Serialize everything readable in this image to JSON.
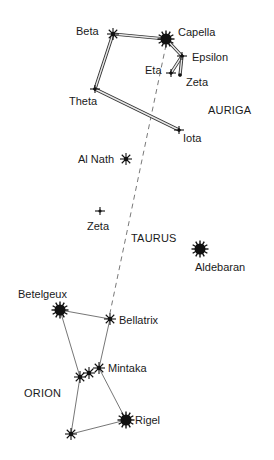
{
  "chart_data": {
    "type": "diagram",
    "title": "",
    "constellations": [
      {
        "name": "AURIGA",
        "label_pos": [
          208,
          104
        ]
      },
      {
        "name": "TAURUS",
        "label_pos": [
          131,
          232
        ]
      },
      {
        "name": "ORION",
        "label_pos": [
          24,
          387
        ]
      }
    ],
    "stars": [
      {
        "id": "beta_aur",
        "name": "Beta",
        "x": 113,
        "y": 34,
        "mag": "medium",
        "label": [
          76,
          25
        ]
      },
      {
        "id": "capella",
        "name": "Capella",
        "x": 166,
        "y": 39,
        "mag": "large",
        "label": [
          178,
          26
        ]
      },
      {
        "id": "epsilon_aur",
        "name": "Epsilon",
        "x": 182,
        "y": 56,
        "mag": "small",
        "label": [
          192,
          51
        ]
      },
      {
        "id": "eta_aur",
        "name": "Eta",
        "x": 171,
        "y": 73,
        "mag": "small",
        "label": [
          145,
          64
        ]
      },
      {
        "id": "zeta_aur",
        "name": "Zeta",
        "x": 180,
        "y": 75,
        "mag": "tiny",
        "label": [
          186,
          76
        ]
      },
      {
        "id": "theta_aur",
        "name": "Theta",
        "x": 95,
        "y": 89,
        "mag": "small",
        "label": [
          69,
          95
        ]
      },
      {
        "id": "iota_aur",
        "name": "Iota",
        "x": 179,
        "y": 130,
        "mag": "small",
        "label": [
          183,
          132
        ]
      },
      {
        "id": "al_nath",
        "name": "Al Nath",
        "x": 126,
        "y": 159,
        "mag": "medium",
        "label": [
          78,
          153
        ]
      },
      {
        "id": "zeta_tau",
        "name": "Zeta",
        "x": 100,
        "y": 211,
        "mag": "small",
        "label": [
          87,
          220
        ]
      },
      {
        "id": "aldebaran",
        "name": "Aldebaran",
        "x": 200,
        "y": 249,
        "mag": "large",
        "label": [
          195,
          261
        ]
      },
      {
        "id": "betelgeux",
        "name": "Betelgeux",
        "x": 60,
        "y": 310,
        "mag": "large",
        "label": [
          18,
          288
        ]
      },
      {
        "id": "bellatrix",
        "name": "Bellatrix",
        "x": 110,
        "y": 319,
        "mag": "medium",
        "label": [
          119,
          314
        ]
      },
      {
        "id": "mintaka",
        "name": "Mintaka",
        "x": 99,
        "y": 368,
        "mag": "medium",
        "label": [
          108,
          362
        ]
      },
      {
        "id": "alnilam",
        "name": "",
        "x": 89,
        "y": 373,
        "mag": "medium",
        "label": null
      },
      {
        "id": "alnitak",
        "name": "",
        "x": 80,
        "y": 377,
        "mag": "medium",
        "label": null
      },
      {
        "id": "rigel",
        "name": "Rigel",
        "x": 126,
        "y": 420,
        "mag": "large",
        "label": [
          135,
          414
        ]
      },
      {
        "id": "saiph",
        "name": "",
        "x": 71,
        "y": 434,
        "mag": "medium",
        "label": null
      }
    ],
    "double_lines": [
      [
        "beta_aur",
        "capella"
      ],
      [
        "capella",
        "epsilon_aur"
      ],
      [
        "epsilon_aur",
        "eta_aur"
      ],
      [
        "epsilon_aur",
        "zeta_aur"
      ],
      [
        "beta_aur",
        "theta_aur"
      ],
      [
        "theta_aur",
        "iota_aur"
      ]
    ],
    "single_lines": [
      [
        "betelgeux",
        "bellatrix"
      ],
      [
        "betelgeux",
        "alnitak"
      ],
      [
        "bellatrix",
        "mintaka"
      ],
      [
        "mintaka",
        "rigel"
      ],
      [
        "alnitak",
        "saiph"
      ],
      [
        "saiph",
        "rigel"
      ]
    ],
    "dashed_lines": [
      [
        "capella",
        "bellatrix"
      ]
    ]
  }
}
